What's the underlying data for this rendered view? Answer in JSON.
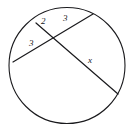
{
  "figure": {
    "kind": "geometry-diagram",
    "background_color": "#ffffff",
    "stroke_color": "#1a1a1d",
    "label_color": "#17171a"
  },
  "circle": {
    "name": "circle",
    "cx": 67,
    "cy": 65.5,
    "r": 58,
    "stroke_width": 1.1,
    "fill": "none"
  },
  "chords": [
    {
      "id": "chord-a",
      "name": "chord-upper-left-to-lower-right",
      "x1": 36,
      "y1": 23,
      "x2": 118,
      "y2": 94,
      "stroke_width": 1.2
    },
    {
      "id": "chord-b",
      "name": "chord-lower-left-to-upper-right",
      "x1": 13,
      "y1": 62,
      "x2": 93,
      "y2": 14,
      "stroke_width": 1.2
    }
  ],
  "intersection": {
    "name": "chord-intersection-point",
    "x": 55,
    "y": 40
  },
  "labels": [
    {
      "id": "label-2",
      "name": "segment-label-2",
      "text": "2",
      "x": 41,
      "y": 17,
      "segment": "chord-a-upper"
    },
    {
      "id": "label-3a",
      "name": "segment-label-3-right",
      "text": "3",
      "x": 63,
      "y": 14,
      "segment": "chord-b-upper-right"
    },
    {
      "id": "label-3b",
      "name": "segment-label-3-left",
      "text": "3",
      "x": 29,
      "y": 39,
      "segment": "chord-b-lower-left"
    },
    {
      "id": "label-x",
      "name": "segment-label-x",
      "text": "x",
      "x": 88,
      "y": 56,
      "segment": "chord-a-lower"
    }
  ],
  "chart_data": {
    "type": "diagram",
    "title": "",
    "shape": "circle",
    "elements": {
      "circle_center": [
        67,
        65.5
      ],
      "circle_radius": 58,
      "chord_a_endpoints": [
        [
          36,
          23
        ],
        [
          118,
          94
        ]
      ],
      "chord_b_endpoints": [
        [
          13,
          62
        ],
        [
          93,
          14
        ]
      ],
      "intersection_point": [
        55,
        40
      ]
    },
    "measured_segments": [
      {
        "label": "2",
        "chord": "chord-a",
        "side": "upper"
      },
      {
        "label": "3",
        "chord": "chord-b",
        "side": "upper-right"
      },
      {
        "label": "3",
        "chord": "chord-b",
        "side": "lower-left"
      },
      {
        "label": "x",
        "chord": "chord-a",
        "side": "lower"
      }
    ]
  }
}
